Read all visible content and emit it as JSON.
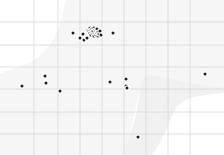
{
  "map": {
    "title": "Point distribution map",
    "width": 224,
    "height": 155,
    "background_color": "#ffffff",
    "land_color": "#f1f1f1",
    "land_color_secondary": "#f6f6f6",
    "graticule_color": "#d8d8d8",
    "graticule_width": 0.8,
    "point_color": "#1c1c1c",
    "point_radius": 1.5,
    "point_halo_color": "#ffffff",
    "point_halo_radius": 2.6,
    "graticule": {
      "vertical_x": [
        34,
        58,
        80,
        102,
        124,
        146,
        168,
        190
      ],
      "horizontal_y": [
        22,
        45,
        67,
        89,
        112,
        134
      ]
    },
    "land_polygon": "M 224,0 L 224,88 L 212,86 L 198,84 L 186,82 L 176,80 L 168,78 L 160,76 L 152,75 L 146,76 L 142,80 L 140,88 L 139,98 L 137,110 L 134,122 L 130,134 L 126,146 L 124,155 L 152,155 L 158,146 L 163,136 L 168,126 L 172,116 L 176,108 L 182,102 L 190,98 L 200,96 L 212,94 L 224,93 L 224,155 L 224,0 Z",
    "land_polygon_secondary": "M 0,74 L 10,70 L 22,66 L 34,60 L 44,52 L 52,42 L 58,30 L 62,18 L 64,8 L 66,0 L 224,0 L 224,92 L 208,90 L 192,86 L 176,82 L 162,78 L 150,76 L 142,80 L 139,92 L 136,108 L 132,124 L 128,140 L 125,155 L 0,155 Z",
    "points": [
      {
        "x": 73,
        "y": 33,
        "label": "point-1"
      },
      {
        "x": 80,
        "y": 38,
        "label": "point-2"
      },
      {
        "x": 83,
        "y": 34,
        "label": "point-3"
      },
      {
        "x": 84,
        "y": 40,
        "label": "point-4"
      },
      {
        "x": 87,
        "y": 38,
        "label": "point-5"
      },
      {
        "x": 88,
        "y": 30,
        "label": "point-6"
      },
      {
        "x": 89,
        "y": 31,
        "label": "point-7"
      },
      {
        "x": 90,
        "y": 28,
        "label": "point-8"
      },
      {
        "x": 90,
        "y": 33,
        "label": "point-9"
      },
      {
        "x": 91,
        "y": 30,
        "label": "point-10"
      },
      {
        "x": 91,
        "y": 35,
        "label": "point-11"
      },
      {
        "x": 92,
        "y": 32,
        "label": "point-12"
      },
      {
        "x": 92,
        "y": 29,
        "label": "point-13"
      },
      {
        "x": 93,
        "y": 34,
        "label": "point-14"
      },
      {
        "x": 93,
        "y": 31,
        "label": "point-15"
      },
      {
        "x": 94,
        "y": 28,
        "label": "point-16"
      },
      {
        "x": 94,
        "y": 36,
        "label": "point-17"
      },
      {
        "x": 95,
        "y": 33,
        "label": "point-18"
      },
      {
        "x": 95,
        "y": 30,
        "label": "point-19"
      },
      {
        "x": 96,
        "y": 35,
        "label": "point-20"
      },
      {
        "x": 96,
        "y": 31,
        "label": "point-21"
      },
      {
        "x": 97,
        "y": 33,
        "label": "point-22"
      },
      {
        "x": 97,
        "y": 29,
        "label": "point-23"
      },
      {
        "x": 98,
        "y": 36,
        "label": "point-24"
      },
      {
        "x": 98,
        "y": 32,
        "label": "point-25"
      },
      {
        "x": 99,
        "y": 34,
        "label": "point-26"
      },
      {
        "x": 100,
        "y": 31,
        "label": "point-27"
      },
      {
        "x": 101,
        "y": 35,
        "label": "point-28"
      },
      {
        "x": 113,
        "y": 33,
        "label": "point-29"
      },
      {
        "x": 22,
        "y": 86,
        "label": "point-30"
      },
      {
        "x": 45,
        "y": 76,
        "label": "point-31"
      },
      {
        "x": 46,
        "y": 83,
        "label": "point-32"
      },
      {
        "x": 60,
        "y": 91,
        "label": "point-33"
      },
      {
        "x": 110,
        "y": 82,
        "label": "point-34"
      },
      {
        "x": 126,
        "y": 79,
        "label": "point-35"
      },
      {
        "x": 126,
        "y": 86,
        "label": "point-36"
      },
      {
        "x": 127,
        "y": 88,
        "label": "point-37"
      },
      {
        "x": 205,
        "y": 74,
        "label": "point-38"
      },
      {
        "x": 138,
        "y": 137,
        "label": "point-39"
      }
    ]
  }
}
